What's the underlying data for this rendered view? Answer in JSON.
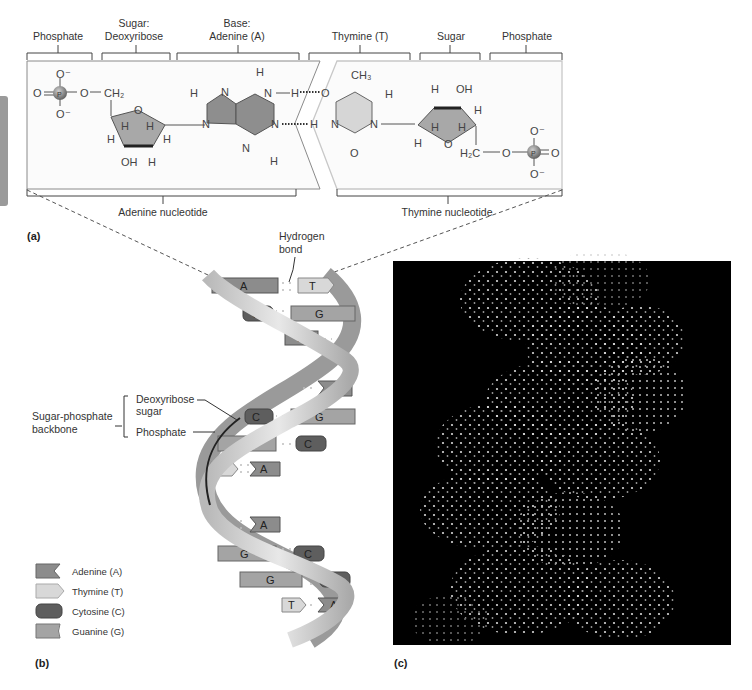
{
  "figure": {
    "panel_a": {
      "label": "(a)",
      "top_labels": [
        {
          "line1": "",
          "line2": "Phosphate"
        },
        {
          "line1": "Sugar:",
          "line2": "Deoxyribose"
        },
        {
          "line1": "Base:",
          "line2": "Adenine (A)"
        },
        {
          "line1": "",
          "line2": "Thymine (T)"
        },
        {
          "line1": "",
          "line2": "Sugar"
        },
        {
          "line1": "",
          "line2": "Phosphate"
        }
      ],
      "bottom_labels": {
        "left": "Adenine nucleotide",
        "right": "Thymine nucleotide"
      },
      "atoms": {
        "O": "O",
        "O_minus": "O⁻",
        "P": "P",
        "CH2": "CH₂",
        "H2C": "H₂C",
        "CH3": "CH₃",
        "H": "H",
        "N": "N",
        "OH": "OH"
      }
    },
    "panel_b": {
      "label": "(b)",
      "callouts": {
        "hydrogen_bond_line1": "Hydrogen",
        "hydrogen_bond_line2": "bond",
        "backbone_line1": "Sugar-phosphate",
        "backbone_line2": "backbone",
        "deoxyribose_line1": "Deoxyribose",
        "deoxyribose_line2": "sugar",
        "phosphate": "Phosphate"
      },
      "base_pairs": [
        {
          "left": "A",
          "right": "T"
        },
        {
          "left": "C",
          "right": "G"
        },
        {
          "left": "A",
          "right": "T"
        },
        {
          "left": "",
          "right": "A"
        },
        {
          "left": "C",
          "right": "G"
        },
        {
          "left": "G",
          "right": "C"
        },
        {
          "left": "T",
          "right": "A"
        },
        {
          "left": "T",
          "right": "A"
        },
        {
          "left": "G",
          "right": "C"
        },
        {
          "left": "G",
          "right": "C"
        },
        {
          "left": "T",
          "right": "A"
        }
      ],
      "legend": [
        {
          "name": "Adenine (A)",
          "color": "#8c8c8c"
        },
        {
          "name": "Thymine (T)",
          "color": "#d8d8d8"
        },
        {
          "name": "Cytosine (C)",
          "color": "#5e5e5e"
        },
        {
          "name": "Guanine (G)",
          "color": "#a4a4a4"
        }
      ]
    },
    "panel_c": {
      "label": "(c)",
      "background": "#000000"
    }
  }
}
